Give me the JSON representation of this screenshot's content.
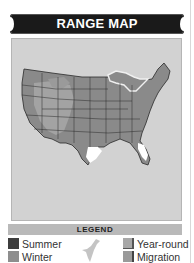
{
  "header": {
    "title": "RANGE MAP"
  },
  "map": {
    "region": "Contiguous United States",
    "colors": {
      "background": "#d2d2d2",
      "summer": "#4a4a4a",
      "winter": "#8c8c8c",
      "year_round": "#9c9c9c",
      "migration": "#b3b3b3",
      "outside": "#ffffff"
    }
  },
  "legend": {
    "title": "LEGEND",
    "items": [
      {
        "label": "Summer",
        "color": "#3d3d3d"
      },
      {
        "label": "Winter",
        "color": "#8e8e8e"
      },
      {
        "label": "Year-round",
        "color": "#a8a8a8"
      },
      {
        "label": "Migration",
        "color": "#9a9a9a"
      }
    ],
    "icon": "bird-silhouette-icon"
  }
}
